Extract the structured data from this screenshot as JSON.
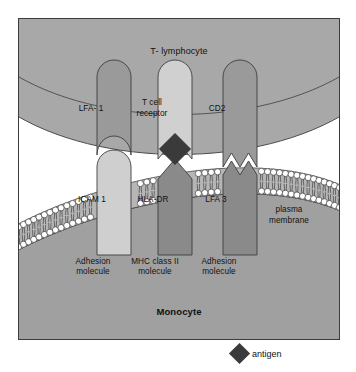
{
  "figure": {
    "type": "biology-diagram"
  },
  "cells": {
    "top": {
      "name": "T- lymphocyte"
    },
    "bottom": {
      "name": "Monocyte"
    },
    "membrane_label": "plasma\nmembrane",
    "membrane_label_line1": "plasma",
    "membrane_label_line2": "membrane"
  },
  "t_cell_receptors": [
    {
      "id": "lfa1",
      "label": "LFA- 1",
      "color": "#9a9a9a",
      "interface": "concave-socket"
    },
    {
      "id": "tcr",
      "label": "T cell",
      "label2": "receptor",
      "color": "#d0d0d0",
      "interface": "notch-v"
    },
    {
      "id": "cd2",
      "label": "CD2",
      "color": "#9a9a9a",
      "interface": "zigzag"
    }
  ],
  "monocyte_receptors": [
    {
      "id": "icam1",
      "label": "ICAM  1",
      "color": "#cfcfcf",
      "caption1": "Adhesion",
      "caption2": "molecule"
    },
    {
      "id": "hladr",
      "label": "HLA-DR",
      "color": "#8a8a8a",
      "caption1": "MHC class II",
      "caption2": "molecule"
    },
    {
      "id": "lfa3",
      "label": "LFA  3",
      "color": "#8a8a8a",
      "caption1": "Adhesion",
      "caption2": "molecule"
    }
  ],
  "legend": {
    "antigen_label": "antigen",
    "antigen_color": "#3a3a3a"
  },
  "colors": {
    "t_cell_body": "#a8a8a8",
    "t_cell_membrane_band": "#9a9a9a",
    "monocyte_body": "#a0a0a0",
    "bilayer_band": "#b6b6b6",
    "lipid_head": "#ffffff",
    "gap": "#ffffff",
    "outline": "#3c3c3c",
    "frame_border": "#3c3c3c"
  }
}
